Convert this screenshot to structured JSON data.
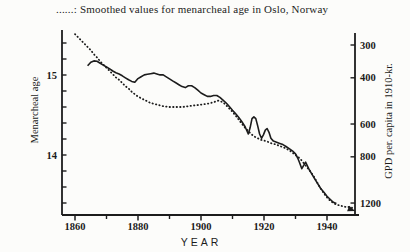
{
  "caption": "......: Smoothed values for menarcheal age in Oslo, Norway",
  "colors": {
    "ink": "#1c1c1c",
    "paper": "#fcfcfa"
  },
  "axes": {
    "x": {
      "title": "YEAR",
      "major_ticks": [
        {
          "year": 1860,
          "label": "1860"
        },
        {
          "year": 1880,
          "label": "1880"
        },
        {
          "year": 1900,
          "label": "1900"
        },
        {
          "year": 1920,
          "label": "1920"
        },
        {
          "year": 1940,
          "label": "1940"
        }
      ],
      "minor_ticks": [
        1870,
        1890,
        1910,
        1930
      ]
    },
    "left": {
      "title": "Menarcheal age",
      "labeled_ticks": [
        {
          "value": 15,
          "label": "15"
        },
        {
          "value": 14,
          "label": "14"
        }
      ],
      "minor_tick_values": [
        15.4,
        15.2,
        15.0,
        14.8,
        14.6,
        14.4,
        14.2,
        14.0,
        13.8,
        13.6,
        13.4
      ]
    },
    "right": {
      "title": "GPD per. capita in 1910-kr.",
      "ticks": [
        {
          "value": 300,
          "label": "300"
        },
        {
          "value": 400,
          "label": "400"
        },
        {
          "value": 600,
          "label": "600"
        },
        {
          "value": 800,
          "label": "800"
        },
        {
          "value": 1200,
          "label": "1200"
        }
      ]
    }
  },
  "chart_data": {
    "type": "line",
    "title": "......: Smoothed values for menarcheal age in Oslo, Norway",
    "x_axis": {
      "label": "YEAR",
      "range": [
        1856,
        1949
      ],
      "ticks": [
        1860,
        1880,
        1900,
        1920,
        1940
      ],
      "grid": false
    },
    "y_axis_left": {
      "label": "Menarcheal age",
      "ticks": [
        15,
        14
      ],
      "range_shown": [
        13.4,
        15.4
      ],
      "direction": "normal"
    },
    "y_axis_right": {
      "label": "GPD per. capita in 1910-kr.",
      "scale": "log",
      "direction": "inverted (300 top, 1200 bottom)",
      "ticks": [
        300,
        400,
        600,
        800,
        1200
      ]
    },
    "legend": "dotted curve = smoothed menarcheal age (left axis); solid curve = GPD per capita in 1910-kr (right axis, inverted log scale)",
    "series": [
      {
        "name": "Smoothed menarcheal age, Oslo",
        "style": "dotted",
        "axis": "left",
        "points": [
          [
            1860,
            15.51
          ],
          [
            1861,
            15.47
          ],
          [
            1862,
            15.43
          ],
          [
            1863,
            15.39
          ],
          [
            1864,
            15.35
          ],
          [
            1865,
            15.31
          ],
          [
            1866,
            15.26
          ],
          [
            1867,
            15.22
          ],
          [
            1868,
            15.17
          ],
          [
            1869,
            15.13
          ],
          [
            1870,
            15.09
          ],
          [
            1871,
            15.05
          ],
          [
            1872,
            15.01
          ],
          [
            1873,
            14.97
          ],
          [
            1874,
            14.94
          ],
          [
            1875,
            14.9
          ],
          [
            1876,
            14.86
          ],
          [
            1877,
            14.83
          ],
          [
            1878,
            14.79
          ],
          [
            1879,
            14.76
          ],
          [
            1880,
            14.73
          ],
          [
            1881,
            14.71
          ],
          [
            1882,
            14.69
          ],
          [
            1883,
            14.67
          ],
          [
            1884,
            14.65
          ],
          [
            1885,
            14.64
          ],
          [
            1886,
            14.63
          ],
          [
            1887,
            14.62
          ],
          [
            1888,
            14.61
          ],
          [
            1890,
            14.6
          ],
          [
            1892,
            14.6
          ],
          [
            1894,
            14.6
          ],
          [
            1896,
            14.61
          ],
          [
            1898,
            14.62
          ],
          [
            1900,
            14.63
          ],
          [
            1902,
            14.64
          ],
          [
            1904,
            14.66
          ],
          [
            1905.5,
            14.68
          ],
          [
            1907,
            14.66
          ],
          [
            1908,
            14.62
          ],
          [
            1909,
            14.58
          ],
          [
            1910,
            14.54
          ],
          [
            1911,
            14.49
          ],
          [
            1912,
            14.44
          ],
          [
            1913,
            14.39
          ],
          [
            1914,
            14.34
          ],
          [
            1915,
            14.3
          ],
          [
            1916,
            14.26
          ],
          [
            1917,
            14.23
          ],
          [
            1918,
            14.21
          ],
          [
            1919,
            14.19
          ],
          [
            1920,
            14.18
          ],
          [
            1921,
            14.17
          ],
          [
            1922,
            14.15
          ],
          [
            1923,
            14.14
          ],
          [
            1924,
            14.13
          ],
          [
            1925,
            14.11
          ],
          [
            1926,
            14.1
          ],
          [
            1927,
            14.08
          ],
          [
            1928,
            14.06
          ],
          [
            1929,
            14.03
          ],
          [
            1930,
            14.0
          ],
          [
            1931,
            13.97
          ],
          [
            1932,
            13.93
          ],
          [
            1933,
            13.88
          ],
          [
            1934,
            13.83
          ],
          [
            1935,
            13.78
          ],
          [
            1936,
            13.72
          ],
          [
            1937,
            13.65
          ],
          [
            1938,
            13.58
          ],
          [
            1939,
            13.52
          ],
          [
            1940,
            13.47
          ],
          [
            1941,
            13.43
          ],
          [
            1942,
            13.4
          ],
          [
            1943,
            13.38
          ],
          [
            1944,
            13.37
          ],
          [
            1945,
            13.36
          ],
          [
            1946,
            13.35
          ],
          [
            1947,
            13.35
          ],
          [
            1948,
            13.34
          ]
        ]
      },
      {
        "name": "GPD per capita in 1910-kr",
        "style": "solid",
        "axis": "right",
        "points": [
          [
            1864,
            360
          ],
          [
            1865,
            349
          ],
          [
            1866,
            345
          ],
          [
            1867,
            346
          ],
          [
            1868,
            352
          ],
          [
            1869,
            358
          ],
          [
            1870,
            364
          ],
          [
            1871,
            370
          ],
          [
            1872,
            377
          ],
          [
            1873,
            383
          ],
          [
            1874,
            387
          ],
          [
            1875,
            393
          ],
          [
            1876,
            400
          ],
          [
            1877,
            407
          ],
          [
            1878,
            413
          ],
          [
            1879,
            416
          ],
          [
            1880,
            403
          ],
          [
            1881,
            396
          ],
          [
            1882,
            390
          ],
          [
            1883,
            388
          ],
          [
            1884,
            386
          ],
          [
            1885,
            384
          ],
          [
            1886,
            387
          ],
          [
            1887,
            390
          ],
          [
            1888,
            390
          ],
          [
            1889,
            397
          ],
          [
            1890,
            404
          ],
          [
            1891,
            411
          ],
          [
            1892,
            418
          ],
          [
            1893,
            425
          ],
          [
            1894,
            432
          ],
          [
            1895,
            436
          ],
          [
            1896,
            429
          ],
          [
            1897,
            429
          ],
          [
            1898,
            436
          ],
          [
            1899,
            446
          ],
          [
            1900,
            457
          ],
          [
            1901,
            464
          ],
          [
            1902,
            471
          ],
          [
            1903,
            471
          ],
          [
            1904,
            467
          ],
          [
            1905,
            467
          ],
          [
            1906,
            475
          ],
          [
            1907,
            487
          ],
          [
            1908,
            499
          ],
          [
            1909,
            515
          ],
          [
            1910,
            532
          ],
          [
            1911,
            548
          ],
          [
            1912,
            566
          ],
          [
            1913,
            588
          ],
          [
            1914,
            615
          ],
          [
            1915,
            655
          ],
          [
            1915.6,
            620
          ],
          [
            1916.2,
            572
          ],
          [
            1916.8,
            563
          ],
          [
            1917.4,
            572
          ],
          [
            1918,
            610
          ],
          [
            1918.6,
            655
          ],
          [
            1919.2,
            680
          ],
          [
            1919.8,
            660
          ],
          [
            1920.4,
            633
          ],
          [
            1921,
            624
          ],
          [
            1921.6,
            645
          ],
          [
            1922.2,
            680
          ],
          [
            1923,
            697
          ],
          [
            1924,
            704
          ],
          [
            1925,
            711
          ],
          [
            1926,
            719
          ],
          [
            1927,
            731
          ],
          [
            1928,
            745
          ],
          [
            1929,
            759
          ],
          [
            1930,
            780
          ],
          [
            1930.7,
            808
          ],
          [
            1931.3,
            842
          ],
          [
            1932,
            888
          ],
          [
            1932.6,
            862
          ],
          [
            1933.2,
            838
          ],
          [
            1933.8,
            868
          ],
          [
            1934.4,
            898
          ],
          [
            1935,
            924
          ],
          [
            1936,
            966
          ],
          [
            1937,
            1010
          ],
          [
            1938,
            1056
          ],
          [
            1939,
            1092
          ],
          [
            1940,
            1130
          ],
          [
            1941,
            1160
          ],
          [
            1942,
            1192
          ],
          [
            1943,
            1205
          ]
        ]
      }
    ],
    "annotations": [
      {
        "type": "arrow",
        "description": "arrowhead at end of dotted curve pointing to right axis just above the 1200 tick",
        "tip_year": 1949,
        "tip_age": 13.3
      }
    ]
  }
}
